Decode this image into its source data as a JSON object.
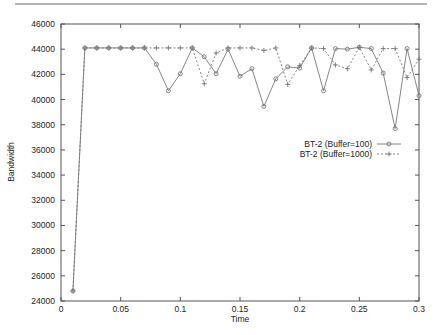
{
  "chart_data": {
    "type": "line",
    "title": "",
    "xlabel": "Time",
    "ylabel": "Bandwidth",
    "xlim": [
      0,
      0.3
    ],
    "ylim": [
      24000,
      46000
    ],
    "x_ticks": [
      0,
      0.05,
      0.1,
      0.15,
      0.2,
      0.25,
      0.3
    ],
    "x_tick_labels": [
      "0",
      "0.05",
      "0.1",
      "0.15",
      "0.2",
      "0.25",
      "0.3"
    ],
    "y_ticks": [
      24000,
      26000,
      28000,
      30000,
      32000,
      34000,
      36000,
      38000,
      40000,
      42000,
      44000,
      46000
    ],
    "y_tick_labels": [
      "24000",
      "26000",
      "28000",
      "30000",
      "32000",
      "34000",
      "36000",
      "38000",
      "40000",
      "42000",
      "44000",
      "46000"
    ],
    "grid": false,
    "legend_position": "right-middle (inside plot)",
    "x": [
      0.01,
      0.02,
      0.03,
      0.04,
      0.05,
      0.06,
      0.07,
      0.08,
      0.09,
      0.1,
      0.11,
      0.12,
      0.13,
      0.14,
      0.15,
      0.16,
      0.17,
      0.18,
      0.19,
      0.2,
      0.21,
      0.22,
      0.23,
      0.24,
      0.25,
      0.26,
      0.27,
      0.28,
      0.29,
      0.3
    ],
    "series": [
      {
        "name": "BT-2 (Buffer=100)",
        "marker": "circle",
        "line_style": "solid",
        "values": [
          24800,
          44100,
          44100,
          44100,
          44100,
          44100,
          44100,
          42800,
          40700,
          42050,
          44100,
          43400,
          42050,
          44000,
          41850,
          42450,
          39450,
          41650,
          42600,
          42500,
          44100,
          40700,
          44050,
          44000,
          44150,
          44050,
          42100,
          37700,
          44050,
          40300
        ]
      },
      {
        "name": "BT-2 (Buffer=1000)",
        "marker": "plus",
        "line_style": "dashed",
        "values": [
          24800,
          44100,
          44100,
          44100,
          44100,
          44100,
          44100,
          44100,
          44100,
          44100,
          44100,
          41250,
          43700,
          44100,
          44100,
          44100,
          43900,
          44100,
          41200,
          42700,
          44100,
          44050,
          42750,
          42450,
          44150,
          42350,
          44050,
          44050,
          41750,
          43200
        ]
      }
    ]
  },
  "colors": {
    "axis": "#555555",
    "series_line": "#777777",
    "text": "#222222"
  }
}
